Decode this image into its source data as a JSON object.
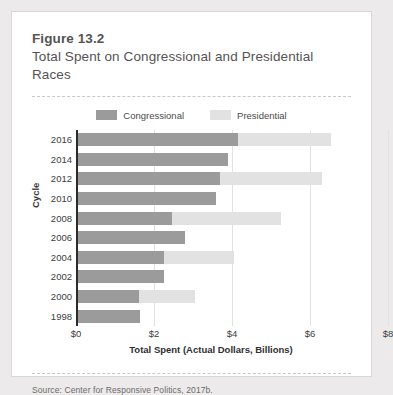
{
  "figure": {
    "number": "Figure 13.2",
    "title": "Total Spent on Congressional and Presidential Races",
    "source": "Source: Center for Responsive Politics, 2017b."
  },
  "colors": {
    "congressional": "#9b9b9b",
    "presidential": "#e2e2e2",
    "axis": "#2b2b2b",
    "gridline": "#e3e1e1",
    "card_background": "#ffffff",
    "page_background": "#eceaea"
  },
  "chart_data": {
    "type": "bar",
    "orientation": "horizontal",
    "stacked": true,
    "title": "Total Spent on Congressional and Presidential Races",
    "xlabel": "Total Spent (Actual Dollars, Billions)",
    "ylabel": "Cycle",
    "xlim": [
      0,
      8
    ],
    "xticks": [
      0,
      2,
      4,
      6,
      8
    ],
    "xticklabels": [
      "$0",
      "$2",
      "$4",
      "$6",
      "$8"
    ],
    "grid": true,
    "legend_position": "top-center",
    "categories": [
      "2016",
      "2014",
      "2012",
      "2010",
      "2008",
      "2006",
      "2004",
      "2002",
      "2000",
      "1998"
    ],
    "series": [
      {
        "name": "Congressional",
        "color": "#9b9b9b",
        "values": [
          4.1,
          3.85,
          3.65,
          3.55,
          2.4,
          2.75,
          2.2,
          2.2,
          1.57,
          1.6
        ]
      },
      {
        "name": "Presidential",
        "color": "#e2e2e2",
        "values": [
          2.4,
          0,
          2.6,
          0,
          2.8,
          0,
          1.8,
          0,
          1.43,
          0
        ]
      }
    ],
    "totals": [
      6.5,
      3.85,
      6.25,
      3.55,
      5.2,
      2.75,
      4.0,
      2.2,
      3.0,
      1.6
    ]
  }
}
